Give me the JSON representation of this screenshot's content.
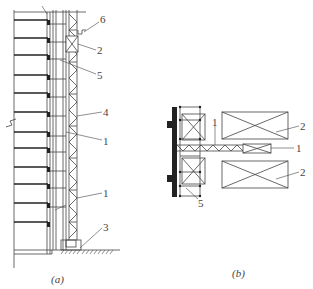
{
  "figure_a": {
    "caption": "(a)",
    "labels": [
      {
        "id": "6",
        "text": "6",
        "x": 100,
        "y": 18
      },
      {
        "id": "2",
        "text": "2",
        "x": 97,
        "y": 46
      },
      {
        "id": "5",
        "text": "5",
        "x": 97,
        "y": 71
      },
      {
        "id": "4",
        "text": "4",
        "x": 103,
        "y": 109
      },
      {
        "id": "1a",
        "text": "1",
        "x": 103,
        "y": 137
      },
      {
        "id": "1b",
        "text": "1",
        "x": 103,
        "y": 191
      },
      {
        "id": "3",
        "text": "3",
        "x": 103,
        "y": 225
      }
    ]
  },
  "figure_b": {
    "caption": "(b)",
    "labels": [
      {
        "id": "2a",
        "text": "2",
        "x": 301,
        "y": 121
      },
      {
        "id": "1a",
        "text": "1",
        "x": 212,
        "y": 121
      },
      {
        "id": "1b",
        "text": "1",
        "x": 296,
        "y": 144
      },
      {
        "id": "2b",
        "text": "2",
        "x": 301,
        "y": 167
      },
      {
        "id": "5",
        "text": "5",
        "x": 199,
        "y": 198
      }
    ]
  },
  "colors": {
    "line": "#444444",
    "heavy": "#222222",
    "background": "#ffffff"
  }
}
